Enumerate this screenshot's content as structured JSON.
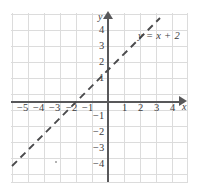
{
  "figure": {
    "name": "coordinate-plane-linear-graph",
    "equation_label": "y = x + 2",
    "axis_label_x": "x",
    "axis_label_y": "y",
    "colors": {
      "grid": "#dcdcdc",
      "axis": "#58585a",
      "line": "#4a4a4c",
      "text": "#3b3b3d",
      "background": "#ffffff"
    }
  },
  "ticks": {
    "x_negative": [
      "−5",
      "−4",
      "−3",
      "−2",
      "−1"
    ],
    "x_positive": [
      "1",
      "2",
      "3",
      "4"
    ],
    "y_positive": [
      "4",
      "3",
      "2",
      "1"
    ],
    "y_negative": [
      "−1",
      "−2",
      "−3",
      "−4"
    ]
  },
  "chart_data": {
    "type": "line",
    "title": "",
    "subtitle": "",
    "xlabel": "x",
    "ylabel": "y",
    "xlim": [
      -6,
      5
    ],
    "ylim": [
      -5,
      5
    ],
    "xticks": [
      -5,
      -4,
      -3,
      -2,
      -1,
      1,
      2,
      3,
      4
    ],
    "yticks": [
      4,
      3,
      2,
      1,
      -1,
      -2,
      -3,
      -4
    ],
    "grid": true,
    "legend": "none",
    "annotations": [
      {
        "text": "y = x + 2",
        "x": 2.0,
        "y": 4.1,
        "style": "italic-equation"
      }
    ],
    "series": [
      {
        "name": "y = x + 2",
        "equation": "y = x + 2",
        "slope": 1,
        "intercept": 2,
        "style": "dashed",
        "color": "#4a4a4c",
        "x_intercept": -2,
        "y_intercept": 2,
        "x": [
          -6.0,
          -5,
          -4,
          -3,
          -2,
          -1,
          0,
          1,
          2,
          3.25
        ],
        "y": [
          -4.0,
          -3,
          -2,
          -1,
          0,
          1,
          2,
          3,
          4,
          5.25
        ],
        "endpoints": [
          {
            "x": -6.0,
            "y": -4.0
          },
          {
            "x": 3.25,
            "y": 5.25
          }
        ]
      }
    ]
  }
}
